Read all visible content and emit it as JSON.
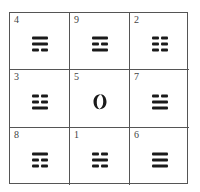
{
  "grid": {
    "rows": 3,
    "cols": 3,
    "line_color": "#555555",
    "symbol_color": "#1a1a1a"
  },
  "cells": [
    {
      "number": "4",
      "symbol": "trigram",
      "name": "xun",
      "meaning": "wind",
      "lines_top_to_bottom": [
        "solid",
        "solid",
        "broken"
      ]
    },
    {
      "number": "9",
      "symbol": "trigram",
      "name": "li",
      "meaning": "fire",
      "lines_top_to_bottom": [
        "solid",
        "broken",
        "solid"
      ]
    },
    {
      "number": "2",
      "symbol": "trigram",
      "name": "kun",
      "meaning": "earth",
      "lines_top_to_bottom": [
        "broken",
        "broken",
        "broken"
      ]
    },
    {
      "number": "3",
      "symbol": "trigram",
      "name": "zhen",
      "meaning": "thunder",
      "lines_top_to_bottom": [
        "broken",
        "broken",
        "solid"
      ]
    },
    {
      "number": "5",
      "symbol": "taiji",
      "name": "center",
      "meaning": "taiji circle"
    },
    {
      "number": "7",
      "symbol": "trigram",
      "name": "dui",
      "meaning": "lake",
      "lines_top_to_bottom": [
        "broken",
        "solid",
        "solid"
      ]
    },
    {
      "number": "8",
      "symbol": "trigram",
      "name": "gen",
      "meaning": "mountain",
      "lines_top_to_bottom": [
        "solid",
        "broken",
        "broken"
      ]
    },
    {
      "number": "1",
      "symbol": "trigram",
      "name": "kan",
      "meaning": "water",
      "lines_top_to_bottom": [
        "broken",
        "solid",
        "broken"
      ]
    },
    {
      "number": "6",
      "symbol": "trigram",
      "name": "qian",
      "meaning": "heaven",
      "lines_top_to_bottom": [
        "solid",
        "solid",
        "solid"
      ]
    }
  ]
}
